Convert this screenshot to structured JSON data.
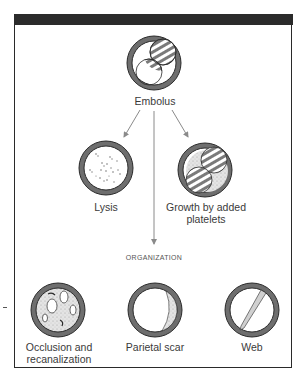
{
  "figure": {
    "nodes": {
      "embolus": {
        "label": "Embolus"
      },
      "lysis": {
        "label": "Lysis"
      },
      "growth": {
        "label": "Growth by added platelets",
        "line1": "Growth by added",
        "line2": "platelets"
      },
      "organization": {
        "label": "ORGANIZATION"
      },
      "occlusion": {
        "label": "Occlusion and recanalization",
        "line1": "Occlusion and",
        "line2": "recanalization"
      },
      "parietal": {
        "label": "Parietal scar"
      },
      "web": {
        "label": "Web"
      }
    },
    "edges": [
      {
        "from": "embolus",
        "to": "lysis"
      },
      {
        "from": "embolus",
        "to": "growth"
      },
      {
        "from": "embolus",
        "to": "organization"
      }
    ],
    "colors": {
      "vessel_wall": "#6e6e6e",
      "outline": "#2a2a2a",
      "arrow": "#8a8a8a",
      "header_band": "#2b2b2b",
      "stipple": "#d6d6d6"
    }
  }
}
